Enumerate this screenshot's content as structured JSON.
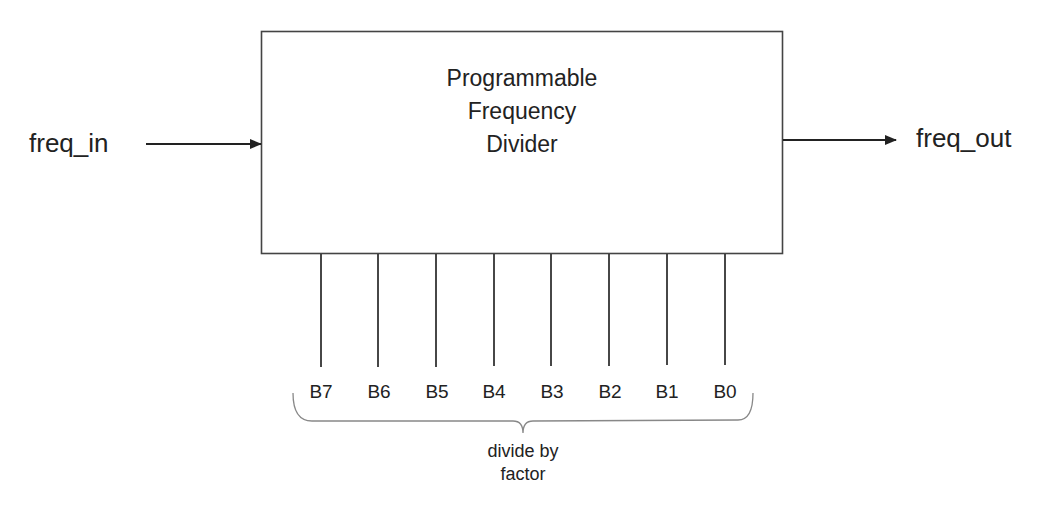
{
  "diagram": {
    "block": {
      "title_lines": [
        "Programmable",
        "Frequency",
        "Divider"
      ]
    },
    "input": {
      "label": "freq_in"
    },
    "output": {
      "label": "freq_out"
    },
    "bits": {
      "labels": [
        "B7",
        "B6",
        "B5",
        "B4",
        "B3",
        "B2",
        "B1",
        "B0"
      ]
    },
    "group": {
      "label_lines": [
        "divide by",
        "factor"
      ]
    },
    "colors": {
      "line": "#333333",
      "text": "#222222",
      "brace": "#888888",
      "background": "#ffffff"
    }
  }
}
